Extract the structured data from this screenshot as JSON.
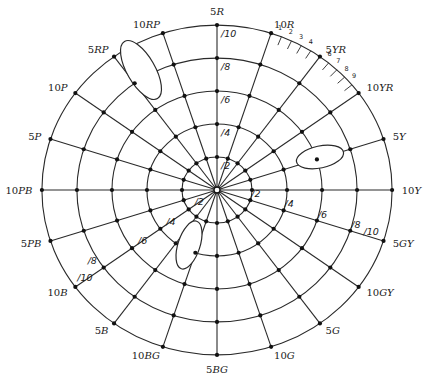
{
  "diagram": {
    "center": [
      217,
      190
    ],
    "px_per_chroma_unit": 17,
    "ring_scale_y": 0.97,
    "rings": [
      {
        "chroma": 2,
        "label": "/2"
      },
      {
        "chroma": 4,
        "label": "/4"
      },
      {
        "chroma": 6,
        "label": "/6"
      },
      {
        "chroma": 8,
        "label": "/8"
      },
      {
        "chroma": 10,
        "label": "/10"
      }
    ],
    "hues": [
      {
        "num": "5",
        "letters": "R",
        "angle": 0
      },
      {
        "num": "10",
        "letters": "R",
        "angle": 18
      },
      {
        "num": "5",
        "letters": "YR",
        "angle": 36
      },
      {
        "num": "10",
        "letters": "YR",
        "angle": 54
      },
      {
        "num": "5",
        "letters": "Y",
        "angle": 72
      },
      {
        "num": "10",
        "letters": "Y",
        "angle": 90
      },
      {
        "num": "5",
        "letters": "GY",
        "angle": 108
      },
      {
        "num": "10",
        "letters": "GY",
        "angle": 126
      },
      {
        "num": "5",
        "letters": "G",
        "angle": 144
      },
      {
        "num": "10",
        "letters": "G",
        "angle": 162
      },
      {
        "num": "5",
        "letters": "BG",
        "angle": 180
      },
      {
        "num": "10",
        "letters": "BG",
        "angle": 198
      },
      {
        "num": "5",
        "letters": "B",
        "angle": 216
      },
      {
        "num": "10",
        "letters": "B",
        "angle": 234
      },
      {
        "num": "5",
        "letters": "PB",
        "angle": 252
      },
      {
        "num": "10",
        "letters": "PB",
        "angle": 270
      },
      {
        "num": "5",
        "letters": "P",
        "angle": 288
      },
      {
        "num": "10",
        "letters": "P",
        "angle": 306
      },
      {
        "num": "5",
        "letters": "RP",
        "angle": 324
      },
      {
        "num": "10",
        "letters": "RP",
        "angle": 342
      }
    ],
    "chroma_label_spokes": [
      {
        "hue": "5R",
        "angle": 0,
        "labels": [
          "/2",
          "/4",
          "/6",
          "/8",
          "/10"
        ],
        "side": "right"
      },
      {
        "hue": "5GY",
        "angle": 108,
        "labels": [
          "/2",
          "/4",
          "/6",
          "/8",
          "/10"
        ],
        "side": "above"
      },
      {
        "hue": "10B",
        "angle": 234,
        "labels": [
          "/2",
          "/4",
          "/6",
          "/8",
          "/10"
        ],
        "side": "above"
      }
    ],
    "hue_ticks": {
      "between": [
        "10R",
        "10YR"
      ],
      "labels": [
        "1",
        "2",
        "3",
        "4",
        "6",
        "7",
        "8",
        "9"
      ],
      "angles": [
        21.6,
        25.2,
        28.8,
        32.4,
        39.6,
        43.2,
        46.8,
        50.4
      ]
    },
    "ellipses": [
      {
        "name": "ellipse-red-purple",
        "cx": 141,
        "cy": 70,
        "rx": 33,
        "ry": 14,
        "rotate": 60
      },
      {
        "name": "ellipse-yellow",
        "cx": 320,
        "cy": 157,
        "rx": 24,
        "ry": 11,
        "rotate": -12
      },
      {
        "name": "ellipse-blue-green",
        "cx": 189,
        "cy": 245,
        "rx": 25,
        "ry": 11,
        "rotate": -72
      }
    ]
  }
}
